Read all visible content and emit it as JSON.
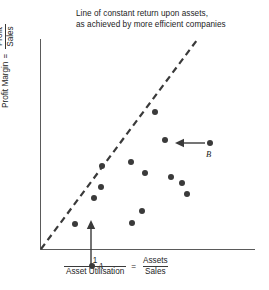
{
  "figure": {
    "title_lines": [
      "Line of constant return upon assets,",
      "as achieved by more efficient companies"
    ],
    "background_color": "#ffffff",
    "axis_color": "#5a5a5a",
    "dot_color": "#3a3a3a",
    "line_color": "#3a3a3a"
  },
  "axes": {
    "y_label": {
      "lead": "Profit Margin",
      "equals": "=",
      "numerator": "Profit",
      "denominator": "Sales"
    },
    "x_label": {
      "left_numerator": "1",
      "left_denominator": "Asset Utilisation",
      "equals": "=",
      "right_numerator": "Assets",
      "right_denominator": "Sales"
    }
  },
  "annotations": [
    {
      "id": "A",
      "label": "A",
      "arrow": "up-arrow-icon"
    },
    {
      "id": "B",
      "label": "B",
      "arrow": "left-arrow-icon"
    }
  ],
  "chart_data": {
    "type": "scatter",
    "title": "Line of constant return upon assets, as achieved by more efficient companies",
    "xlabel": "1 / Asset Utilisation = Assets / Sales",
    "ylabel": "Profit Margin = Profit / Sales",
    "grid": false,
    "legend": null,
    "xlim": [
      0,
      215
    ],
    "ylim": [
      0,
      211
    ],
    "axis_units": "unlabelled (schematic axes, no tick marks)",
    "points": [
      {
        "x": 61,
        "y": 63,
        "label": ""
      },
      {
        "x": 62,
        "y": 84,
        "label": ""
      },
      {
        "x": 35,
        "y": 26,
        "label": ""
      },
      {
        "x": 54,
        "y": 52,
        "label": ""
      },
      {
        "x": 91,
        "y": 88,
        "label": ""
      },
      {
        "x": 92,
        "y": 27,
        "label": ""
      },
      {
        "x": 102,
        "y": 39,
        "label": ""
      },
      {
        "x": 105,
        "y": 77,
        "label": ""
      },
      {
        "x": 115,
        "y": 138,
        "label": ""
      },
      {
        "x": 125,
        "y": 110,
        "label": ""
      },
      {
        "x": 131,
        "y": 73,
        "label": ""
      },
      {
        "x": 142,
        "y": 67,
        "label": ""
      },
      {
        "x": 147,
        "y": 56,
        "label": ""
      },
      {
        "x": 170,
        "y": 107,
        "label": "B"
      },
      {
        "x": 52,
        "y": -16,
        "label": "A"
      }
    ],
    "points_px": [
      {
        "name": "p1",
        "cx": 101,
        "cy": 187
      },
      {
        "name": "p2",
        "cx": 102,
        "cy": 166
      },
      {
        "name": "p3",
        "cx": 75,
        "cy": 224
      },
      {
        "name": "p4",
        "cx": 94,
        "cy": 198
      },
      {
        "name": "p5",
        "cx": 131,
        "cy": 162
      },
      {
        "name": "p6",
        "cx": 132,
        "cy": 223
      },
      {
        "name": "p7",
        "cx": 142,
        "cy": 211
      },
      {
        "name": "p8",
        "cx": 145,
        "cy": 173
      },
      {
        "name": "p9",
        "cx": 155,
        "cy": 112
      },
      {
        "name": "p10",
        "cx": 165,
        "cy": 140
      },
      {
        "name": "p11",
        "cx": 171,
        "cy": 177
      },
      {
        "name": "p12",
        "cx": 182,
        "cy": 183
      },
      {
        "name": "p13",
        "cx": 187,
        "cy": 194
      },
      {
        "name": "pB",
        "cx": 210,
        "cy": 143
      },
      {
        "name": "pA",
        "cx": 92,
        "cy": 266
      }
    ],
    "trend_line": {
      "style": "dashed",
      "description": "Line of constant return upon assets",
      "x1": 41,
      "y1": 249,
      "x2": 198,
      "y2": 40
    }
  }
}
